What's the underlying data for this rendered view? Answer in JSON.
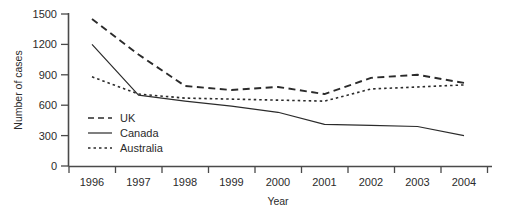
{
  "chart_data": {
    "type": "line",
    "title": "",
    "xlabel": "Year",
    "ylabel": "Number of cases",
    "categories": [
      "1996",
      "1997",
      "1998",
      "1999",
      "2000",
      "2001",
      "2002",
      "2003",
      "2004"
    ],
    "x": [
      1996,
      1997,
      1998,
      1999,
      2000,
      2001,
      2002,
      2003,
      2004
    ],
    "series": [
      {
        "name": "UK",
        "style": "dashed",
        "color": "#2b2b2b",
        "values": [
          1450,
          1100,
          790,
          750,
          780,
          710,
          870,
          900,
          820
        ]
      },
      {
        "name": "Canada",
        "style": "solid",
        "color": "#2b2b2b",
        "values": [
          1200,
          700,
          640,
          590,
          530,
          410,
          400,
          390,
          300
        ]
      },
      {
        "name": "Australia",
        "style": "dotted",
        "color": "#2b2b2b",
        "values": [
          880,
          710,
          670,
          660,
          650,
          640,
          760,
          780,
          800
        ]
      }
    ],
    "ylim": [
      0,
      1500
    ],
    "yticks": [
      0,
      300,
      600,
      900,
      1200,
      1500
    ],
    "ytick_labels": [
      "0",
      "300",
      "600",
      "900",
      "1200",
      "1500"
    ],
    "grid": false,
    "legend_position": "inside-lower-left"
  },
  "axes": {
    "y_title": "Number of cases",
    "x_title": "Year",
    "y_tick_labels": [
      "1500",
      "1200",
      "900",
      "600",
      "300",
      "0"
    ],
    "x_tick_labels": [
      "1996",
      "1997",
      "1998",
      "1999",
      "2000",
      "2001",
      "2002",
      "2003",
      "2004"
    ]
  },
  "legend": {
    "entries": [
      {
        "label": "UK",
        "style": "dashed"
      },
      {
        "label": "Canada",
        "style": "solid"
      },
      {
        "label": "Australia",
        "style": "dotted"
      }
    ]
  },
  "colors": {
    "ink": "#2b2b2b",
    "axis": "#4a4a4a",
    "background": "#ffffff"
  }
}
